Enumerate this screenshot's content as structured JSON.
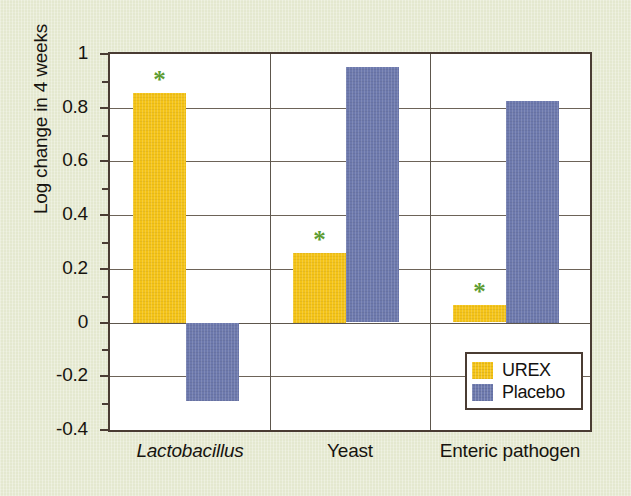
{
  "figure": {
    "background_color": "#E4E8CF",
    "plot_background_color": "#FFFFFF",
    "frame_color": "#4A3C33"
  },
  "chart_data": {
    "type": "bar",
    "title": "",
    "subtitle": "",
    "xlabel": "",
    "ylabel": "Log change in 4 weeks",
    "categories": [
      "Lactobacillus",
      "Yeast",
      "Enteric pathogen"
    ],
    "category_styles": [
      "italic",
      "normal",
      "normal"
    ],
    "series": [
      {
        "name": "UREX",
        "color": "#F4C317",
        "values": [
          0.855,
          0.26,
          0.065
        ],
        "annotations": [
          "*",
          "*",
          "*"
        ]
      },
      {
        "name": "Placebo",
        "color": "#6D79AD",
        "values": [
          -0.29,
          0.95,
          0.825
        ],
        "annotations": [
          "",
          "",
          ""
        ]
      }
    ],
    "ylim": [
      -0.4,
      1.0
    ],
    "ytick_values": [
      -0.4,
      -0.2,
      0,
      0.2,
      0.4,
      0.6,
      0.8,
      1
    ],
    "ytick_labels": [
      "-0.4",
      "-0.2",
      "0",
      "0.2",
      "0.4",
      "0.6",
      "0.8",
      "1"
    ],
    "yminor_tick_values": [
      -0.3,
      -0.1,
      0.1,
      0.3,
      0.5,
      0.7,
      0.9
    ],
    "grid": true,
    "grid_axis": "y",
    "group_separators": true,
    "legend": {
      "position": "lower-right-inside",
      "entries": [
        {
          "label": "UREX",
          "color": "#F4C317"
        },
        {
          "label": "Placebo",
          "color": "#6D79AD"
        }
      ]
    },
    "annotation_note": {
      "symbol": "*",
      "color": "#5D9C32",
      "applies_to": "UREX"
    }
  }
}
